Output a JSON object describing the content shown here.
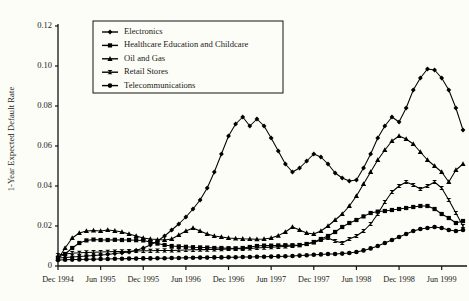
{
  "chart_data": {
    "type": "line",
    "title": "",
    "xlabel": "",
    "ylabel": "1-Year Expected Default Rate",
    "ylim": [
      0,
      0.12
    ],
    "yticks": [
      "0",
      "0.02",
      "0.04",
      "0.06",
      "0.08",
      "0.10",
      "0.12"
    ],
    "ytick_values": [
      0,
      0.02,
      0.04,
      0.06,
      0.08,
      0.1,
      0.12
    ],
    "grid": false,
    "legend_position": "top-center",
    "xtick_labels": [
      "Dec 1994",
      "Jun 1995",
      "Dec 1995",
      "Jun 1996",
      "Dec 1996",
      "Jun 1997",
      "Dec 1997",
      "Jun 1998",
      "Dec 1998",
      "Jun 1999"
    ],
    "x_start": "Dec 1994",
    "x_end": "Sep 1999",
    "x_step": "1 month",
    "x": [
      "Dec 1994",
      "Jan 1995",
      "Feb 1995",
      "Mar 1995",
      "Apr 1995",
      "May 1995",
      "Jun 1995",
      "Jul 1995",
      "Aug 1995",
      "Sep 1995",
      "Oct 1995",
      "Nov 1995",
      "Dec 1995",
      "Jan 1996",
      "Feb 1996",
      "Mar 1996",
      "Apr 1996",
      "May 1996",
      "Jun 1996",
      "Jul 1996",
      "Aug 1996",
      "Sep 1996",
      "Oct 1996",
      "Nov 1996",
      "Dec 1996",
      "Jan 1997",
      "Feb 1997",
      "Mar 1997",
      "Apr 1997",
      "May 1997",
      "Jun 1997",
      "Jul 1997",
      "Aug 1997",
      "Sep 1997",
      "Oct 1997",
      "Nov 1997",
      "Dec 1997",
      "Jan 1998",
      "Feb 1998",
      "Mar 1998",
      "Apr 1998",
      "May 1998",
      "Jun 1998",
      "Jul 1998",
      "Aug 1998",
      "Sep 1998",
      "Oct 1998",
      "Nov 1998",
      "Dec 1998",
      "Jan 1999",
      "Feb 1999",
      "Mar 1999",
      "Apr 1999",
      "May 1999",
      "Jun 1999",
      "Jul 1999",
      "Aug 1999",
      "Sep 1999"
    ],
    "series": [
      {
        "name": "Electronics",
        "marker": "diamond",
        "color": "#000000",
        "values": [
          0.004,
          0.0042,
          0.0045,
          0.0048,
          0.005,
          0.0052,
          0.0055,
          0.0058,
          0.0062,
          0.0066,
          0.007,
          0.0078,
          0.009,
          0.0105,
          0.0125,
          0.015,
          0.018,
          0.021,
          0.0245,
          0.0285,
          0.033,
          0.039,
          0.047,
          0.056,
          0.065,
          0.071,
          0.0745,
          0.07,
          0.0735,
          0.07,
          0.064,
          0.0575,
          0.051,
          0.047,
          0.049,
          0.0525,
          0.056,
          0.0545,
          0.051,
          0.0465,
          0.044,
          0.0425,
          0.043,
          0.049,
          0.056,
          0.064,
          0.07,
          0.0745,
          0.072,
          0.079,
          0.088,
          0.094,
          0.0985,
          0.098,
          0.094,
          0.088,
          0.079,
          0.068
        ]
      },
      {
        "name": "Healthcare  Education and Childcare",
        "marker": "square",
        "color": "#000000",
        "values": [
          0.0042,
          0.006,
          0.009,
          0.0115,
          0.0128,
          0.0132,
          0.013,
          0.013,
          0.0131,
          0.013,
          0.013,
          0.0129,
          0.0128,
          0.012,
          0.0112,
          0.0105,
          0.01,
          0.0098,
          0.0096,
          0.0094,
          0.0093,
          0.0092,
          0.009,
          0.009,
          0.0089,
          0.0088,
          0.009,
          0.0095,
          0.01,
          0.0102,
          0.0102,
          0.0103,
          0.0104,
          0.0104,
          0.0105,
          0.011,
          0.012,
          0.0135,
          0.015,
          0.017,
          0.0195,
          0.0215,
          0.023,
          0.0248,
          0.0265,
          0.0272,
          0.0275,
          0.028,
          0.0285,
          0.029,
          0.0295,
          0.03,
          0.03,
          0.0285,
          0.026,
          0.024,
          0.0215,
          0.0225
        ]
      },
      {
        "name": "Oil and Gas",
        "marker": "triangle",
        "color": "#000000",
        "values": [
          0.0035,
          0.009,
          0.014,
          0.0165,
          0.0175,
          0.0178,
          0.0175,
          0.018,
          0.0176,
          0.017,
          0.016,
          0.015,
          0.014,
          0.0135,
          0.0132,
          0.013,
          0.0135,
          0.0155,
          0.0175,
          0.019,
          0.0175,
          0.016,
          0.015,
          0.0145,
          0.014,
          0.0138,
          0.0136,
          0.0135,
          0.0134,
          0.0135,
          0.014,
          0.0152,
          0.017,
          0.0195,
          0.018,
          0.0165,
          0.016,
          0.0175,
          0.02,
          0.023,
          0.026,
          0.03,
          0.035,
          0.041,
          0.047,
          0.053,
          0.058,
          0.0625,
          0.065,
          0.0635,
          0.061,
          0.057,
          0.053,
          0.05,
          0.047,
          0.042,
          0.048,
          0.051
        ]
      },
      {
        "name": "Retail Stores",
        "marker": "bowtie",
        "color": "#000000",
        "values": [
          0.0055,
          0.006,
          0.0064,
          0.0066,
          0.0068,
          0.0069,
          0.007,
          0.0071,
          0.0072,
          0.0073,
          0.0074,
          0.0075,
          0.0076,
          0.0076,
          0.0077,
          0.0078,
          0.0078,
          0.0079,
          0.008,
          0.0081,
          0.0082,
          0.0082,
          0.0083,
          0.0084,
          0.0085,
          0.0086,
          0.0086,
          0.0088,
          0.009,
          0.0092,
          0.0094,
          0.0096,
          0.0098,
          0.01,
          0.0104,
          0.011,
          0.0118,
          0.013,
          0.014,
          0.0125,
          0.0115,
          0.0135,
          0.015,
          0.0175,
          0.021,
          0.026,
          0.032,
          0.037,
          0.04,
          0.042,
          0.0405,
          0.0385,
          0.04,
          0.042,
          0.039,
          0.033,
          0.0265,
          0.02
        ]
      },
      {
        "name": "Telecommunications",
        "marker": "circle",
        "color": "#000000",
        "values": [
          0.003,
          0.0031,
          0.0032,
          0.0033,
          0.0034,
          0.0034,
          0.0035,
          0.0035,
          0.0036,
          0.0036,
          0.0037,
          0.0037,
          0.0038,
          0.0038,
          0.0039,
          0.0039,
          0.004,
          0.004,
          0.0041,
          0.0041,
          0.0042,
          0.0042,
          0.0043,
          0.0043,
          0.0044,
          0.0044,
          0.0045,
          0.0045,
          0.0046,
          0.0046,
          0.0047,
          0.0048,
          0.0049,
          0.005,
          0.0052,
          0.0054,
          0.0056,
          0.0058,
          0.006,
          0.006,
          0.0062,
          0.0065,
          0.007,
          0.0078,
          0.0088,
          0.01,
          0.0115,
          0.013,
          0.0145,
          0.016,
          0.0175,
          0.0185,
          0.019,
          0.0195,
          0.019,
          0.018,
          0.0175,
          0.018
        ]
      }
    ]
  }
}
